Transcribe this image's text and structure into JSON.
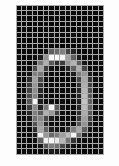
{
  "image": {
    "kind": "pixel-grid-digit-bitmap",
    "description": "Low-resolution grayscale pixel grid showing a handwritten digit",
    "digit_label": "0",
    "background_color": "#fdfdfd",
    "grid_line_color": "#a9a9a9",
    "dark_cell_color": "#0c0c0c",
    "bright_cell_color": "#ffffff",
    "panel": {
      "left_px": 16,
      "top_px": 5,
      "width_px": 88,
      "height_px": 150
    }
  },
  "grid": {
    "columns": 16,
    "rows": 27,
    "cell_width_px": 5.5,
    "cell_height_px": 5.55,
    "value_min": 0,
    "value_max": 255,
    "pixels": [
      [
        8,
        12,
        6,
        14,
        9,
        5,
        11,
        7,
        13,
        6,
        10,
        8,
        12,
        5,
        9,
        7
      ],
      [
        10,
        6,
        13,
        8,
        5,
        12,
        9,
        6,
        11,
        14,
        7,
        10,
        6,
        12,
        8,
        5
      ],
      [
        6,
        11,
        9,
        5,
        13,
        7,
        10,
        12,
        8,
        6,
        13,
        9,
        11,
        7,
        5,
        10
      ],
      [
        12,
        8,
        6,
        11,
        9,
        14,
        6,
        10,
        7,
        12,
        8,
        5,
        13,
        9,
        11,
        6
      ],
      [
        7,
        13,
        10,
        6,
        12,
        8,
        11,
        5,
        14,
        9,
        6,
        12,
        7,
        10,
        8,
        13
      ],
      [
        9,
        6,
        12,
        14,
        7,
        10,
        13,
        9,
        6,
        11,
        12,
        8,
        10,
        6,
        13,
        9
      ],
      [
        11,
        10,
        8,
        9,
        13,
        6,
        12,
        10,
        9,
        7,
        14,
        11,
        8,
        12,
        6,
        10
      ],
      [
        8,
        12,
        14,
        10,
        6,
        13,
        9,
        11,
        7,
        12,
        8,
        10,
        13,
        6,
        11,
        9
      ],
      [
        6,
        9,
        11,
        13,
        8,
        20,
        95,
        108,
        130,
        66,
        34,
        12,
        9,
        14,
        7,
        11
      ],
      [
        13,
        7,
        10,
        12,
        30,
        148,
        250,
        252,
        246,
        160,
        96,
        28,
        11,
        8,
        13,
        6
      ],
      [
        9,
        14,
        6,
        22,
        118,
        176,
        88,
        44,
        60,
        150,
        178,
        92,
        24,
        12,
        9,
        13
      ],
      [
        11,
        8,
        13,
        74,
        168,
        60,
        18,
        12,
        16,
        38,
        96,
        172,
        70,
        9,
        12,
        8
      ],
      [
        7,
        12,
        20,
        128,
        120,
        22,
        10,
        14,
        8,
        16,
        28,
        124,
        150,
        26,
        8,
        12
      ],
      [
        10,
        6,
        44,
        160,
        74,
        14,
        9,
        12,
        11,
        8,
        14,
        70,
        168,
        52,
        13,
        9
      ],
      [
        12,
        9,
        58,
        150,
        52,
        11,
        13,
        8,
        14,
        10,
        9,
        48,
        176,
        66,
        10,
        14
      ],
      [
        8,
        13,
        66,
        142,
        40,
        9,
        12,
        14,
        7,
        13,
        11,
        40,
        182,
        78,
        12,
        7
      ],
      [
        14,
        10,
        74,
        130,
        30,
        13,
        8,
        11,
        9,
        12,
        14,
        34,
        190,
        88,
        9,
        13
      ],
      [
        9,
        12,
        88,
        246,
        26,
        10,
        14,
        9,
        13,
        7,
        10,
        30,
        196,
        96,
        14,
        8
      ],
      [
        11,
        7,
        60,
        140,
        34,
        120,
        248,
        92,
        20,
        11,
        8,
        36,
        188,
        104,
        10,
        12
      ],
      [
        13,
        14,
        38,
        126,
        90,
        176,
        154,
        60,
        14,
        9,
        13,
        44,
        174,
        88,
        12,
        9
      ],
      [
        8,
        9,
        24,
        112,
        134,
        72,
        28,
        16,
        10,
        13,
        7,
        58,
        160,
        70,
        14,
        11
      ],
      [
        12,
        11,
        16,
        84,
        150,
        38,
        12,
        9,
        14,
        8,
        12,
        82,
        148,
        44,
        9,
        13
      ],
      [
        10,
        13,
        9,
        46,
        166,
        96,
        30,
        18,
        12,
        44,
        126,
        168,
        96,
        22,
        13,
        8
      ],
      [
        14,
        8,
        12,
        26,
        244,
        150,
        104,
        124,
        158,
        190,
        244,
        110,
        32,
        10,
        8,
        12
      ],
      [
        9,
        12,
        7,
        14,
        96,
        240,
        246,
        232,
        184,
        118,
        52,
        20,
        12,
        13,
        11,
        9
      ],
      [
        13,
        6,
        11,
        9,
        22,
        86,
        124,
        110,
        74,
        34,
        14,
        8,
        13,
        7,
        12,
        10
      ],
      [
        7,
        11,
        13,
        8,
        12,
        18,
        26,
        22,
        16,
        10,
        9,
        13,
        6,
        11,
        8,
        14
      ]
    ]
  },
  "caption": {
    "text": "0"
  }
}
